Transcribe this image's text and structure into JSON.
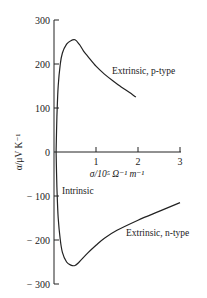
{
  "chart_data": {
    "type": "line",
    "title": "",
    "xlabel": "σ/10⁵ Ω⁻¹ m⁻¹",
    "ylabel": "α/μV K⁻¹",
    "xlim": [
      0,
      3
    ],
    "ylim": [
      -300,
      300
    ],
    "grid": false,
    "legend": null,
    "x_ticks": [
      "1",
      "2",
      "3"
    ],
    "y_ticks": [
      "300",
      "200",
      "100",
      "0",
      "− 100",
      "− 200",
      "− 300"
    ],
    "series": [
      {
        "name": "Extrinsic, p-type",
        "x": [
          0.05,
          0.07,
          0.1,
          0.15,
          0.2,
          0.3,
          0.4,
          0.5,
          0.6,
          0.7,
          0.8,
          1.0,
          1.2,
          1.4,
          1.6,
          1.8,
          1.95
        ],
        "y": [
          0,
          80,
          150,
          200,
          225,
          245,
          253,
          255,
          245,
          230,
          218,
          195,
          177,
          162,
          148,
          135,
          125
        ]
      },
      {
        "name": "Extrinsic, n-type",
        "x": [
          0.05,
          0.07,
          0.1,
          0.15,
          0.2,
          0.3,
          0.4,
          0.5,
          0.6,
          0.8,
          1.0,
          1.2,
          1.5,
          2.0,
          2.5,
          3.0
        ],
        "y": [
          0,
          -80,
          -150,
          -200,
          -228,
          -250,
          -257,
          -258,
          -250,
          -230,
          -212,
          -196,
          -178,
          -155,
          -135,
          -115
        ]
      }
    ],
    "annotations": [
      {
        "text": "Extrinsic, p-type",
        "x": 1.1,
        "y": 185
      },
      {
        "text": "Intrinsic",
        "x": 0.1,
        "y": -40
      },
      {
        "text": "Extrinsic, n-type",
        "x": 1.7,
        "y": -195
      }
    ]
  }
}
